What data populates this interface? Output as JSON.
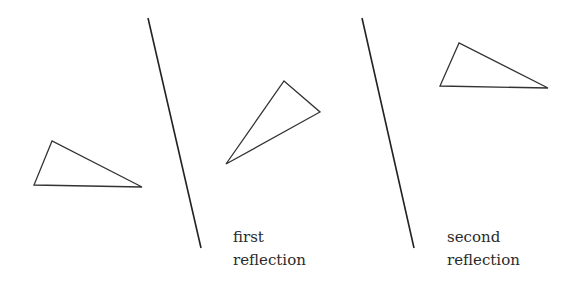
{
  "diagram": {
    "stroke_color": "#333333",
    "labels": {
      "first": [
        "first",
        "reflection"
      ],
      "second": [
        "second",
        "reflection"
      ]
    },
    "shapes": {
      "original_triangle": [
        [
          52,
          141
        ],
        [
          34,
          185
        ],
        [
          142,
          187
        ]
      ],
      "first_mirror_line": [
        [
          148,
          18
        ],
        [
          201,
          248
        ]
      ],
      "first_reflected_triangle": [
        [
          284,
          81
        ],
        [
          320,
          112
        ],
        [
          226,
          164
        ]
      ],
      "second_mirror_line": [
        [
          362,
          18
        ],
        [
          414,
          248
        ]
      ],
      "second_reflected_triangle": [
        [
          459,
          43
        ],
        [
          440,
          86
        ],
        [
          548,
          88
        ]
      ]
    }
  }
}
